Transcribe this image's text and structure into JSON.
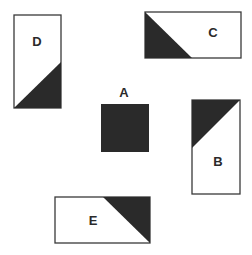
{
  "diagram": {
    "title": "",
    "colors": {
      "background": "#ffffff",
      "outline": "#3a3a3a",
      "fill": "#2a2a2a"
    },
    "shapes": [
      {
        "id": "D",
        "label": "D",
        "kind": "rectangle-with-diagonal-shading",
        "orientation": "portrait",
        "rect": {
          "x": 14,
          "y": 15,
          "w": 47,
          "h": 93
        },
        "shaded_region": "bottom-right triangle",
        "triangle": [
          [
            14,
            108
          ],
          [
            61,
            62
          ],
          [
            61,
            108
          ]
        ],
        "label_pos": {
          "x": 37,
          "y": 46
        }
      },
      {
        "id": "C",
        "label": "C",
        "kind": "rectangle-with-diagonal-shading",
        "orientation": "landscape",
        "rect": {
          "x": 145,
          "y": 12,
          "w": 96,
          "h": 46
        },
        "shaded_region": "bottom-left triangle",
        "triangle": [
          [
            145,
            12
          ],
          [
            145,
            58
          ],
          [
            192,
            58
          ]
        ],
        "label_pos": {
          "x": 213,
          "y": 37
        }
      },
      {
        "id": "A",
        "label": "A",
        "kind": "filled-square",
        "orientation": "square",
        "rect": {
          "x": 101,
          "y": 104,
          "w": 48,
          "h": 48
        },
        "shaded_region": "entire square",
        "triangle": [],
        "label_pos": {
          "x": 124,
          "y": 97
        }
      },
      {
        "id": "B",
        "label": "B",
        "kind": "rectangle-with-diagonal-shading",
        "orientation": "portrait",
        "rect": {
          "x": 192,
          "y": 100,
          "w": 48,
          "h": 94
        },
        "shaded_region": "top-left triangle",
        "triangle": [
          [
            192,
            100
          ],
          [
            240,
            100
          ],
          [
            192,
            148
          ]
        ],
        "label_pos": {
          "x": 218,
          "y": 166
        }
      },
      {
        "id": "E",
        "label": "E",
        "kind": "rectangle-with-diagonal-shading",
        "orientation": "landscape",
        "rect": {
          "x": 55,
          "y": 197,
          "w": 95,
          "h": 46
        },
        "shaded_region": "top-right triangle",
        "triangle": [
          [
            103,
            197
          ],
          [
            150,
            197
          ],
          [
            150,
            243
          ]
        ],
        "label_pos": {
          "x": 93,
          "y": 225
        }
      }
    ]
  }
}
